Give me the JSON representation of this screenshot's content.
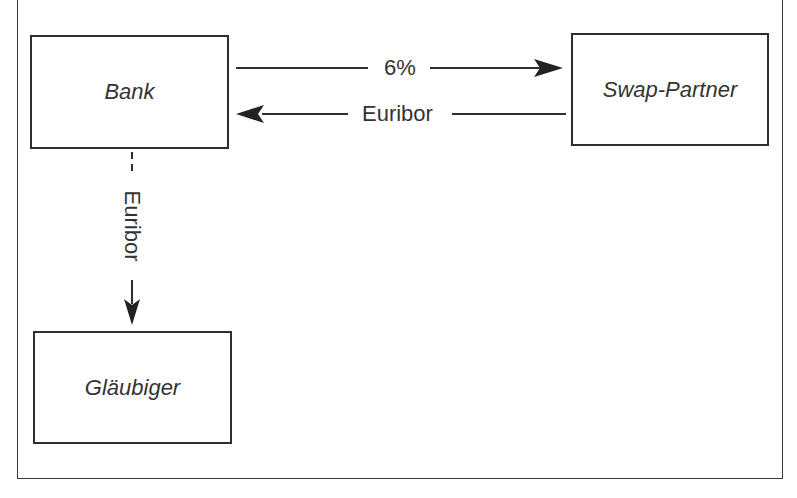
{
  "diagram": {
    "nodes": {
      "bank": "Bank",
      "swap_partner": "Swap-Partner",
      "glaeubiger": "Gläubiger"
    },
    "edges": [
      {
        "from": "Bank",
        "to": "Swap-Partner",
        "label": "6%",
        "style": "solid"
      },
      {
        "from": "Swap-Partner",
        "to": "Bank",
        "label": "Euribor",
        "style": "solid"
      },
      {
        "from": "Bank",
        "to": "Gläubiger",
        "label": "Euribor",
        "style": "dashed-then-solid"
      }
    ],
    "labels": {
      "fixed_rate": "6%",
      "euribor_horizontal": "Euribor",
      "euribor_vertical": "Euribor"
    }
  },
  "colors": {
    "stroke": "#2e2e2e",
    "text": "#333333",
    "background": "#ffffff"
  }
}
